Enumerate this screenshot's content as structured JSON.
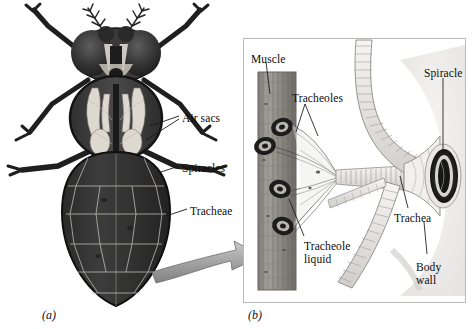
{
  "figure": {
    "panels": [
      {
        "caption": "(a)",
        "name": "whole-insect-dorsal-view",
        "description": "Dorsal view of a fly showing internal tracheal system",
        "labels": [
          {
            "id": "air-sacs",
            "text": "Air sacs",
            "x": 182,
            "y": 112
          },
          {
            "id": "spiracles",
            "text": "Spiracles",
            "x": 182,
            "y": 162
          },
          {
            "id": "tracheae",
            "text": "Tracheae",
            "x": 190,
            "y": 205
          }
        ]
      },
      {
        "caption": "(b)",
        "name": "tracheole-detail-view",
        "description": "Detail of spiracle, trachea, tracheoles and muscle",
        "labels": [
          {
            "id": "muscle",
            "text": "Muscle",
            "x": 251,
            "y": 53
          },
          {
            "id": "tracheoles",
            "text": "Tracheoles",
            "x": 292,
            "y": 92
          },
          {
            "id": "spiracle",
            "text": "Spiracle",
            "x": 424,
            "y": 67
          },
          {
            "id": "tracheole-liquid",
            "text": "Tracheole\nliquid",
            "x": 304,
            "y": 240
          },
          {
            "id": "trachea",
            "text": "Trachea",
            "x": 394,
            "y": 212
          },
          {
            "id": "body-wall",
            "text": "Body\nwall",
            "x": 416,
            "y": 261
          }
        ]
      }
    ],
    "connector": {
      "name": "magnification-arrow",
      "description": "Curved 3D arrow from insect abdomen to detail panel",
      "color": "#9a9a9a"
    },
    "colors": {
      "background": "#ffffff",
      "ink": "#111111",
      "body_dark": "#2b2b2b",
      "body_mid": "#4e4e4e",
      "air_sac_light": "#e8e6e0",
      "panel_border": "#b9b9b9",
      "muscle_fill": "#8f8c86",
      "trachea_fill": "#efeeec",
      "arrow_fill": "#9a9a9a"
    }
  }
}
